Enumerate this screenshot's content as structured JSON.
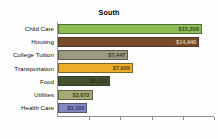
{
  "chart_data": {
    "type": "bar",
    "orientation": "horizontal",
    "title": "South",
    "xlabel": "",
    "ylabel": "",
    "grid": false,
    "legend": false,
    "xlim": [
      0,
      16500
    ],
    "x_tick_count": 5,
    "categories": [
      "Child Care",
      "Housing",
      "College Tuition",
      "Transportation",
      "Food",
      "Utilities",
      "Health Care"
    ],
    "values": [
      15208,
      14940,
      7447,
      7929,
      5510,
      3672,
      3105
    ],
    "value_labels": [
      "$15,208",
      "$14,940",
      "$7,447",
      "$7,929",
      "$5,510",
      "$3,672",
      "$3,105"
    ],
    "bar_colors": [
      "#8CBE54",
      "#7A4B28",
      "#9C9A82",
      "#EFAE2A",
      "#46512F",
      "#A8AC74",
      "#8389BE"
    ],
    "value_label_colors": [
      "#3B4A1E",
      "#D8C9B4",
      "#3A3A2C",
      "#4A3A10",
      "#2B3120",
      "#3A3F22",
      "#2C3160"
    ]
  }
}
